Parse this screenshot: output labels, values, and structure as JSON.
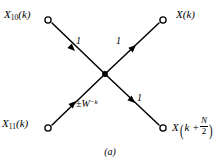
{
  "figure": {
    "caption": "(a)",
    "background_color": "#ffffff",
    "stroke_color": "#000000",
    "type": "signal-flow-graph-butterfly"
  },
  "nodes": {
    "top_left": {
      "name": "X",
      "subscript": "10",
      "argument": "(k)",
      "marker": "open-circle",
      "x": 48,
      "y": 20
    },
    "top_right": {
      "name": "X",
      "subscript": "",
      "argument": "(k)",
      "marker": "open-circle",
      "x": 163,
      "y": 20
    },
    "bottom_left": {
      "name": "X",
      "subscript": "11",
      "argument": "(k)",
      "marker": "open-circle",
      "x": 48,
      "y": 128
    },
    "bottom_right": {
      "name": "X",
      "subscript": "",
      "argument_prefix": "k +",
      "fraction_numerator": "N",
      "fraction_denominator": "2",
      "marker": "open-circle",
      "x": 163,
      "y": 128
    },
    "center": {
      "marker": "solid-dot",
      "x": 105,
      "y": 74
    }
  },
  "branches": [
    {
      "id": "top-left-to-center",
      "from": "top_left",
      "to": "center",
      "gain": "1",
      "arrow_direction": "down-right"
    },
    {
      "id": "center-to-top-right",
      "from": "center",
      "to": "top_right",
      "gain": "1",
      "arrow_direction": "up-right"
    },
    {
      "id": "bottom-left-to-center",
      "from": "bottom_left",
      "to": "center",
      "gain_sign": "±",
      "gain_symbol": "W",
      "gain_exponent": "−k",
      "arrow_direction": "up-right"
    },
    {
      "id": "center-to-bottom-right",
      "from": "center",
      "to": "bottom_right",
      "gain": "1",
      "arrow_direction": "down-right"
    }
  ],
  "labels": {
    "gain_top_left": "1",
    "gain_top_right": "1",
    "gain_bottom_right": "1",
    "gain_bottom_left_sign": "±",
    "gain_bottom_left_symbol": "W",
    "gain_bottom_left_exponent": "−k",
    "node_tl_name": "X",
    "node_tl_sub": "10",
    "node_tl_arg": "(k)",
    "node_tr_name": "X",
    "node_tr_arg": "(k)",
    "node_bl_name": "X",
    "node_bl_sub": "11",
    "node_bl_arg": "(k)",
    "node_br_name": "X",
    "node_br_arg_prefix": "k +",
    "node_br_frac_num": "N",
    "node_br_frac_den": "2"
  }
}
